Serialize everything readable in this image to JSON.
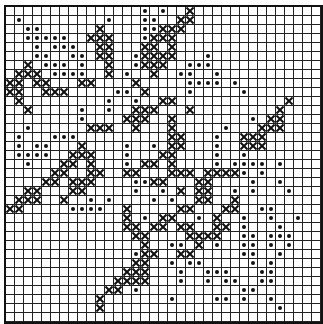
{
  "pattern": {
    "cols": 35,
    "rows": 35,
    "legend": {
      "X": "cross-stitch",
      "o": "dot-stitch",
      ".": "empty"
    },
    "grid": [
      "...............o.o..X..............",
      ".o.........o...oo..XX..............",
      "..oo......X....ooXXX...............",
      "..ooooo..XXX...oXXX................",
      "...o.ooo..XX...XX.X................",
      "...oo..oo.XX..oXXXX...o............",
      "..X.ooo.o..X..oXXX..ooo............",
      ".XXX.oooo..X.o..X..oo..o...........",
      "XX.XX...XX....X.....oooo.o.........",
      "XX..XXX.....oo.X....o.....o........",
      ".X.........o..o..XX............X...",
      "..X.....o..o..XXX...X.........X....",
      "........o....XXX..X........o.XX....",
      "..o......XXX..X...X.....o...XXX....",
      ".o...ooo..........XX...o..XXX......",
      ".o.oo...X....o..o.XX...o..XXX......",
      ".oooo..XXX...o...XX....o..o........",
      "..o...XX.X...o.XX.X....o.oooo.o....",
      ".....XX..XX..XX...XXX.XXXXo.o......",
      "....XX.XXX....ooXX...XX....o..o....",
      "..XX...XX.....o..o.X.XX..o.o...o...",
      ".XXX..X..o.o....o.o..XX..X.........",
      "XX.....oooo..X.....XX...XX..oo.....",
      ".............X.o.XX..o.X..o..o..o..",
      ".............XX.XX.XX..XX.o...o....",
      "..............XX....XXXX..oo.ooo...",
      "...............X..oo.X.o..oo.o.o...",
      "..............oXX..XX.....oo..o....",
      "..............XX..o.oo.....o.o.....",
      ".............XXX...o..ooo...oo.....",
      "............XXXX...o..o.oo..oo.....",
      "...........XX.o...........oo.......",
      "..........X.......o....oo.o..o.....",
      "..........X...................o....",
      "...................................o"
    ]
  }
}
